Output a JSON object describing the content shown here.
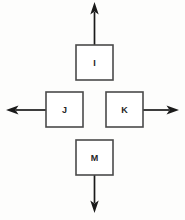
{
  "diagram": {
    "canvas": {
      "width": 185,
      "height": 220,
      "background": "#fdfdfc"
    },
    "style": {
      "box_fill": "#ffffff",
      "box_stroke": "#4a4a4a",
      "label_color": "#252525",
      "arrow_color": "#1a1a1a"
    },
    "blocks": [
      {
        "id": "block-i",
        "label": "I",
        "position": "top",
        "box": {
          "x": 76,
          "y": 45,
          "width": 37,
          "height": 35
        },
        "label_point": {
          "x": 94.5,
          "y": 63
        },
        "arrow": {
          "direction": "up",
          "name": "arrow-up",
          "line": {
            "x1": 94.5,
            "y1": 45,
            "x2": 94.5,
            "y2": 12
          },
          "tip": {
            "x": 94.5,
            "y": 2
          }
        }
      },
      {
        "id": "block-j",
        "label": "J",
        "position": "middle-left",
        "box": {
          "x": 46,
          "y": 92,
          "width": 37,
          "height": 35
        },
        "label_point": {
          "x": 64.5,
          "y": 110
        },
        "arrow": {
          "direction": "left",
          "name": "arrow-left",
          "line": {
            "x1": 46,
            "y1": 110,
            "x2": 16,
            "y2": 110
          },
          "tip": {
            "x": 6,
            "y": 110
          }
        }
      },
      {
        "id": "block-k",
        "label": "K",
        "position": "middle-right",
        "box": {
          "x": 106,
          "y": 92,
          "width": 37,
          "height": 35
        },
        "label_point": {
          "x": 124.5,
          "y": 110
        },
        "arrow": {
          "direction": "right",
          "name": "arrow-right",
          "line": {
            "x1": 143,
            "y1": 110,
            "x2": 169,
            "y2": 110
          },
          "tip": {
            "x": 179,
            "y": 110
          }
        }
      },
      {
        "id": "block-m",
        "label": "M",
        "position": "bottom",
        "box": {
          "x": 76,
          "y": 140,
          "width": 37,
          "height": 35
        },
        "label_point": {
          "x": 94.5,
          "y": 158
        },
        "arrow": {
          "direction": "down",
          "name": "arrow-down",
          "line": {
            "x1": 94.5,
            "y1": 175,
            "x2": 94.5,
            "y2": 203
          },
          "tip": {
            "x": 94.5,
            "y": 213
          }
        }
      }
    ]
  }
}
